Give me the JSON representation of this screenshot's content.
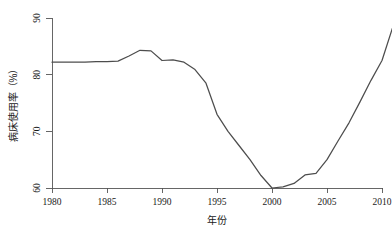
{
  "chart_data": {
    "type": "line",
    "title": "",
    "subtitle": "",
    "xlabel": "年份",
    "ylabel": "病床使用率（%）",
    "xlim": [
      1980,
      2011
    ],
    "ylim": [
      59,
      90
    ],
    "grid": false,
    "legend": "none",
    "line_color": "#4d4d4d",
    "axis_color": "#555555",
    "xticks": [
      1980,
      1985,
      1990,
      1995,
      2000,
      2005,
      2010
    ],
    "xtick_labels": [
      "1980",
      "1985",
      "1990",
      "1995",
      "2000",
      "2005",
      "2010"
    ],
    "yticks": [
      60,
      70,
      80,
      90
    ],
    "ytick_labels": [
      "60",
      "70",
      "80",
      "90"
    ],
    "series": [
      {
        "name": "病床使用率",
        "x": [
          1980,
          1981,
          1982,
          1983,
          1984,
          1985,
          1986,
          1987,
          1988,
          1989,
          1990,
          1991,
          1992,
          1993,
          1994,
          1995,
          1996,
          1997,
          1998,
          1999,
          2000,
          2001,
          2002,
          2003,
          2004,
          2005,
          2006,
          2007,
          2008,
          2009,
          2010,
          2011
        ],
        "values": [
          82.2,
          82.2,
          82.2,
          82.2,
          82.3,
          82.3,
          82.4,
          83.3,
          84.3,
          84.2,
          82.5,
          82.6,
          82.2,
          80.9,
          78.5,
          73.0,
          70.0,
          67.5,
          65.0,
          62.2,
          60.0,
          60.2,
          60.8,
          62.3,
          62.6,
          65.0,
          68.3,
          71.5,
          75.2,
          79.0,
          82.5,
          88.5
        ]
      }
    ]
  },
  "axis": {
    "ylabel": "病床使用率（%）",
    "xlabel": "年份"
  },
  "figure": {
    "background": "#ffffff"
  }
}
